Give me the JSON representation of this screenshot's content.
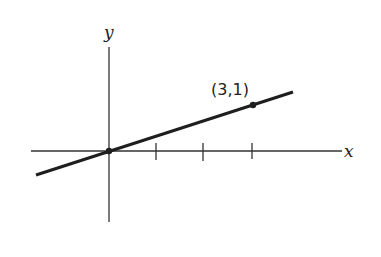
{
  "diagram": {
    "type": "coordinate-plane-line",
    "axes": {
      "x_label": "x",
      "y_label": "y"
    },
    "tick_marks_x": [
      1,
      2,
      3
    ],
    "line": {
      "description": "line through origin and point (3,1)",
      "slope": "1/3"
    },
    "points": [
      {
        "name": "origin",
        "x": 0,
        "y": 0,
        "label": ""
      },
      {
        "name": "point-3-1",
        "x": 3,
        "y": 1,
        "label": "(3,1)"
      }
    ],
    "colors": {
      "ink": "#222222",
      "background": "#ffffff"
    }
  }
}
